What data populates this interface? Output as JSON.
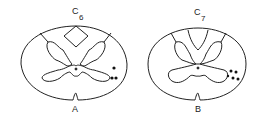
{
  "figure": {
    "panels": [
      {
        "id": "A",
        "segment": "C",
        "segment_num": "6",
        "label": "A",
        "dots": 3
      },
      {
        "id": "B",
        "segment": "C",
        "segment_num": "7",
        "label": "B",
        "dots": 5
      }
    ]
  }
}
